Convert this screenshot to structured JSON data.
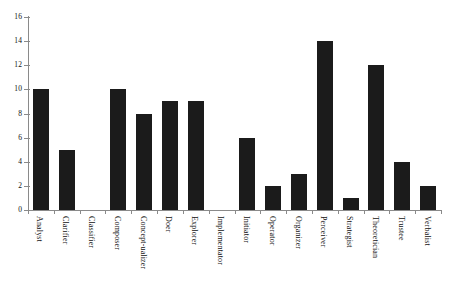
{
  "chart_data": {
    "type": "bar",
    "title": "",
    "subtitle": "",
    "xlabel": "",
    "ylabel": "",
    "ylim": [
      0,
      16
    ],
    "ytick_labels": [
      "0",
      "2",
      "4",
      "6",
      "8",
      "10",
      "12",
      "14",
      "16"
    ],
    "ytick_values": [
      0,
      2,
      4,
      6,
      8,
      10,
      12,
      14,
      16
    ],
    "grid": false,
    "legend": false,
    "legend_position": "none",
    "bar_color": "#1b1b1b",
    "axis_color": "#8a8a8a",
    "background_color": "#ffffff",
    "xtick_label_rotation": 90,
    "categories": [
      "Analyst",
      "Clarifier",
      "Classifier",
      "Composer",
      "Concept-ualizer",
      "Doer",
      "Explorer",
      "Implementator",
      "Initiator",
      "Operator",
      "Organizer",
      "Perceiver",
      "Strategist",
      "Theoretician",
      "Trustee",
      "Verbalist"
    ],
    "values": [
      10,
      5,
      0,
      10,
      8,
      9,
      9,
      0,
      6,
      2,
      3,
      14,
      1,
      12,
      4,
      2
    ]
  }
}
